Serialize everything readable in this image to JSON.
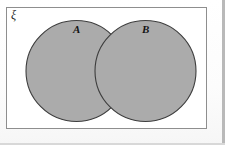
{
  "diagram": {
    "type": "venn",
    "universal_set": {
      "symbol": "ξ",
      "name": "universal-set-rectangle",
      "border_color": "#8e8e8e",
      "fill_color": "#ffffff"
    },
    "sets": [
      {
        "id": "A",
        "label": "A",
        "shape": "circle",
        "cx": 76.5,
        "cy": 71,
        "r": 50.5,
        "fill_color": "#ababab",
        "stroke_color": "#3d3d3d",
        "label_position": {
          "x": 77,
          "y": 30
        }
      },
      {
        "id": "B",
        "label": "B",
        "shape": "circle",
        "cx": 145.5,
        "cy": 71,
        "r": 50.5,
        "fill_color": "#ababab",
        "stroke_color": "#3d3d3d",
        "label_position": {
          "x": 146,
          "y": 30
        }
      }
    ],
    "intersection": {
      "shaded": true,
      "fill_color": "#ababab",
      "note": "A and B overlap; intersection rendered the same grey as each set"
    },
    "canvas": {
      "width": 225,
      "height": 145,
      "background": "#fdfdfd"
    }
  }
}
